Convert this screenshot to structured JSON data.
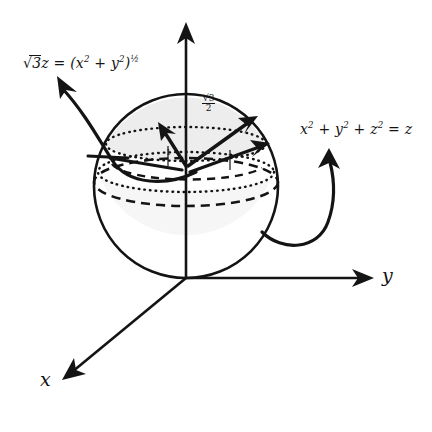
{
  "figure": {
    "type": "3d-geometry-diagram",
    "background": "#ffffff",
    "ink_color": "#141414",
    "shade_color": "#eeeeee"
  },
  "axes": {
    "x": {
      "label": "x",
      "direction": "down-left",
      "arrow": true
    },
    "y": {
      "label": "y",
      "direction": "right",
      "arrow": true
    },
    "z": {
      "label": "",
      "direction": "up",
      "arrow": true
    },
    "origin": {
      "x": 186,
      "y": 278
    }
  },
  "annotations": {
    "cone": {
      "text": "√3z = (x² + y²)½",
      "parts": {
        "coef": "3",
        "lhs_var": "z",
        "eq": "=",
        "rhs": "(x",
        "exp1": "2",
        "plus": "+",
        "var2": "y",
        "exp2": "2",
        "close": ")",
        "power": "½"
      },
      "arrow": "curved-up-left"
    },
    "sphere": {
      "text": "x² + y² + z² = z",
      "parts": {
        "x": "x",
        "x_exp": "2",
        "plus1": "+",
        "y": "y",
        "y_exp": "2",
        "plus2": "+",
        "z": "z",
        "z_exp": "2",
        "eq": "=",
        "rhs": "z"
      },
      "arrow": "curved-up-right"
    },
    "radius": {
      "numerator": "√3",
      "denominator": "2",
      "note": "intersection circle radius"
    },
    "tick_half_left": "1",
    "tick_half_right": "2"
  },
  "shapes": {
    "sphere": {
      "cx": 186,
      "cy": 186,
      "r": 92,
      "outline": "solid",
      "fill": "none"
    },
    "cap_shade": {
      "fill": "#ededed",
      "top_of_sphere_to_intersection_plane": true
    },
    "intersection_ellipse": {
      "cx": 186,
      "cy": 144,
      "rx": 80,
      "ry": 17,
      "style": "dotted"
    },
    "equator_ellipse_dashed": {
      "cx": 186,
      "cy": 182,
      "rx": 92,
      "ry": 24,
      "style": "dashed"
    },
    "inner_ellipse_dotted": {
      "cx": 186,
      "cy": 172,
      "rx": 88,
      "ry": 20,
      "style": "dotted"
    },
    "radius_arrows": [
      {
        "from": "center",
        "to": "up-left",
        "head": true
      },
      {
        "from": "center",
        "to": "up-right",
        "head": true
      },
      {
        "from": "center",
        "to": "right",
        "head": true
      },
      {
        "from": "center",
        "to": "left",
        "head": true
      }
    ]
  }
}
